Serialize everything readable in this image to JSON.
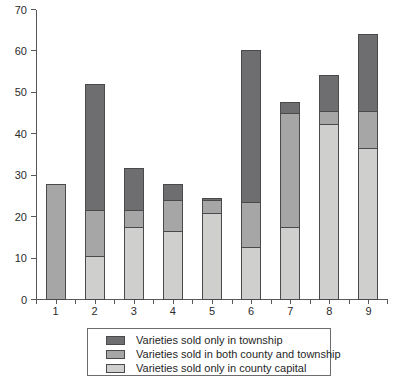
{
  "chart_data": {
    "type": "bar",
    "subtype": "stacked-vertical",
    "title": "",
    "xlabel": "",
    "ylabel": "",
    "categories": [
      "1",
      "2",
      "3",
      "4",
      "5",
      "6",
      "7",
      "8",
      "9"
    ],
    "ylim": [
      0,
      70
    ],
    "yticks": [
      0,
      10,
      20,
      30,
      40,
      50,
      60,
      70
    ],
    "ytick_labels": [
      "0",
      "10",
      "20",
      "30",
      "40",
      "50",
      "60",
      "70"
    ],
    "grid": false,
    "legend_position": "below-plot",
    "series": [
      {
        "name": "Varieties sold only in county capital",
        "color": "#cfcfcd",
        "stack_order": 1,
        "values": [
          0,
          10.5,
          17.5,
          16.3,
          20.8,
          12.5,
          17.5,
          42.3,
          36.5
        ]
      },
      {
        "name": "Varieties sold in both county and township",
        "color": "#a6a6a6",
        "stack_order": 2,
        "values": [
          27.7,
          11.0,
          4.0,
          7.7,
          3.0,
          10.8,
          27.3,
          3.2,
          9.0
        ]
      },
      {
        "name": "Varieties sold only in township",
        "color": "#6e6e70",
        "stack_order": 3,
        "values": [
          0,
          30.5,
          10.2,
          3.8,
          0.7,
          36.7,
          2.8,
          8.5,
          18.5
        ]
      }
    ],
    "totals": [
      27.7,
      52.0,
      31.7,
      27.8,
      24.5,
      60.0,
      47.6,
      54.0,
      64.0
    ]
  },
  "legend": {
    "items": [
      {
        "label": "Varieties sold only in township",
        "color": "#6e6e70"
      },
      {
        "label": "Varieties sold in both county and township",
        "color": "#a6a6a6"
      },
      {
        "label": "Varieties sold only in county capital",
        "color": "#cfcfcd"
      }
    ]
  }
}
